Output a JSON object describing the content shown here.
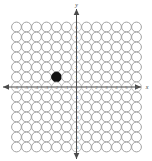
{
  "figure": {
    "background_color": "#ffffff"
  },
  "chart_data": {
    "type": "scatter",
    "title": "",
    "xlabel": "x",
    "ylabel": "y",
    "xlim": [
      -6,
      6
    ],
    "ylim": [
      -6,
      6
    ],
    "grid": true,
    "legend": null,
    "x_tick_labels": [
      "-6",
      "-5",
      "-4",
      "-3",
      "-2",
      "-1",
      "0",
      "1",
      "2",
      "3",
      "4",
      "5",
      "6"
    ],
    "y_tick_labels": [
      "6",
      "5",
      "4",
      "3",
      "2",
      "1",
      "0",
      "-1",
      "-2",
      "-3",
      "-4",
      "-5",
      "-6"
    ],
    "marker_style": "open-circle",
    "marked_marker_style": "filled-circle",
    "marked_color": "#111111",
    "unmarked_fill": "#ffffff",
    "unmarked_stroke": "#9a9a9a",
    "axis_color": "#4a4a4a",
    "tick_label_color": "#6e6e6e",
    "series": [
      {
        "name": "marked point",
        "points": [
          {
            "x": -2,
            "y": 1,
            "label": "(-2, 1)",
            "filled": true
          }
        ]
      }
    ],
    "grid_columns": 13,
    "grid_rows": 13
  },
  "axes": {
    "x_axis_name": "x",
    "y_axis_name": "y",
    "origin_label": "0"
  }
}
